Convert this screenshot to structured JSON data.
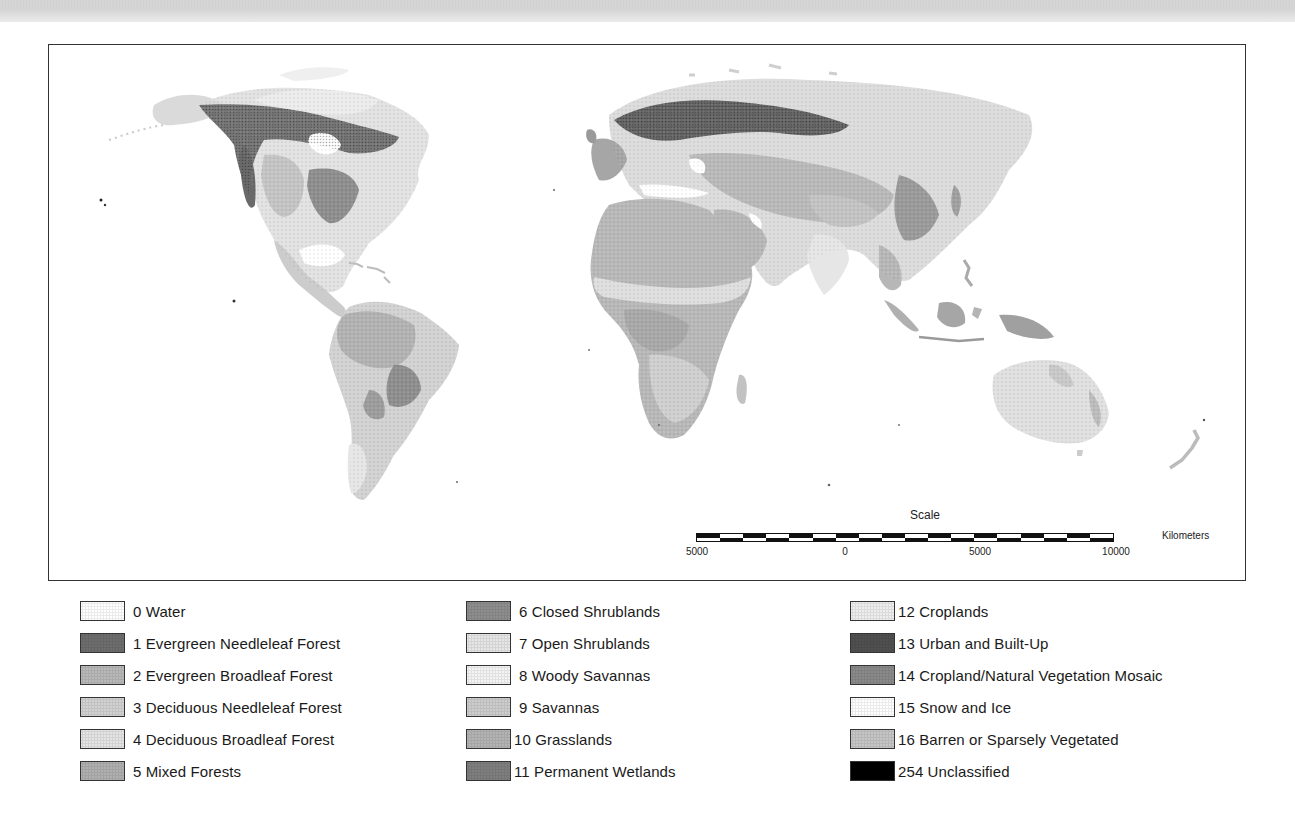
{
  "map": {
    "title": "Global Land Cover Classification",
    "scale": {
      "title": "Scale",
      "unit": "Kilometers",
      "ticks": [
        {
          "label": "5000",
          "x": 697
        },
        {
          "label": "0",
          "x": 845
        },
        {
          "label": "5000",
          "x": 980
        },
        {
          "label": "10000",
          "x": 1116
        }
      ],
      "segments_top": [
        "#111",
        "#fff",
        "#111",
        "#fff",
        "#111",
        "#fff",
        "#111",
        "#fff",
        "#111",
        "#fff",
        "#111",
        "#fff",
        "#111",
        "#fff",
        "#111",
        "#fff",
        "#111",
        "#fff"
      ],
      "segments_bottom": [
        "#fff",
        "#111",
        "#fff",
        "#111",
        "#fff",
        "#111",
        "#fff",
        "#111",
        "#fff",
        "#111",
        "#fff",
        "#111",
        "#fff",
        "#111",
        "#fff",
        "#111",
        "#fff",
        "#111"
      ]
    }
  },
  "legend": {
    "columns": [
      {
        "x": 0,
        "items": [
          {
            "code": "0",
            "label": "0 Water",
            "color": "#ffffff"
          },
          {
            "code": "1",
            "label": "1 Evergreen Needleleaf Forest",
            "color": "#6e6e6e"
          },
          {
            "code": "2",
            "label": "2 Evergreen Broadleaf Forest",
            "color": "#b9b9b9"
          },
          {
            "code": "3",
            "label": "3 Deciduous Needleleaf Forest",
            "color": "#d2d2d2"
          },
          {
            "code": "4",
            "label": "4 Deciduous Broadleaf Forest",
            "color": "#e4e4e4"
          },
          {
            "code": "5",
            "label": "5 Mixed Forests",
            "color": "#b0b0b0"
          }
        ]
      },
      {
        "x": 386,
        "items": [
          {
            "code": "6",
            "label": "6 Closed Shrublands",
            "color": "#8e8e8e"
          },
          {
            "code": "7",
            "label": "7 Open Shrublands",
            "color": "#e6e6e6"
          },
          {
            "code": "8",
            "label": "8 Woody Savannas",
            "color": "#f4f4f4"
          },
          {
            "code": "9",
            "label": "9 Savannas",
            "color": "#cdcdcd"
          },
          {
            "code": "10",
            "label": "10 Grasslands",
            "color": "#b4b4b4"
          },
          {
            "code": "11",
            "label": "11 Permanent Wetlands",
            "color": "#7f7f7f"
          }
        ]
      },
      {
        "x": 770,
        "items": [
          {
            "code": "12",
            "label": "12 Croplands",
            "color": "#eeeeee"
          },
          {
            "code": "13",
            "label": "13 Urban and Built-Up",
            "color": "#505050"
          },
          {
            "code": "14",
            "label": "14 Cropland/Natural Vegetation Mosaic",
            "color": "#8a8a8a"
          },
          {
            "code": "15",
            "label": "15 Snow and Ice",
            "color": "#ffffff"
          },
          {
            "code": "16",
            "label": "16 Barren or Sparsely Vegetated",
            "color": "#c6c6c6"
          },
          {
            "code": "254",
            "label": "254 Unclassified",
            "color": "#000000"
          }
        ]
      }
    ]
  },
  "colors": {
    "frame_border": "#333333",
    "background": "#ffffff",
    "barren": "#b8b8b8",
    "forest_dark": "#6e6e6e",
    "grass": "#c8c8c8",
    "shrub_light": "#e2e2e2",
    "tropical": "#b6b6b6"
  }
}
